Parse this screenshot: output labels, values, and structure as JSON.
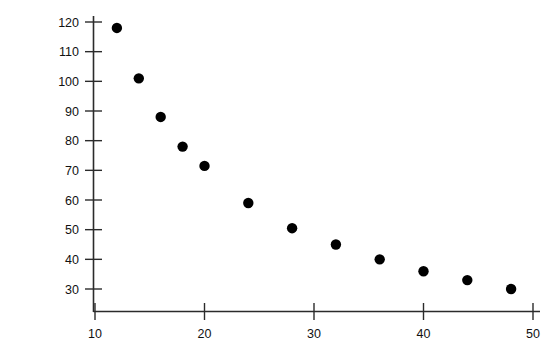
{
  "chart_data": {
    "type": "scatter",
    "title": "",
    "xlabel": "",
    "ylabel": "Pressure (in. of Hg)",
    "xlim": [
      8,
      50
    ],
    "ylim": [
      25,
      124
    ],
    "grid": false,
    "legend": null,
    "xticks": [
      10,
      20,
      30,
      40,
      50
    ],
    "xticklabels": [
      "10",
      "20",
      "30",
      "40",
      "50"
    ],
    "yticks": [
      30,
      40,
      50,
      60,
      70,
      80,
      90,
      100,
      110,
      120
    ],
    "yticklabels": [
      "30",
      "40",
      "50",
      "60",
      "70",
      "80",
      "90",
      "100",
      "110",
      "120"
    ],
    "x": [
      12,
      14,
      16,
      18,
      20,
      24,
      28,
      32,
      36,
      40,
      44,
      48
    ],
    "y": [
      118,
      101,
      88,
      78,
      71.5,
      59,
      50.5,
      45,
      40,
      36,
      33,
      30
    ],
    "points": [
      {
        "x": 12,
        "y": 118
      },
      {
        "x": 14,
        "y": 101
      },
      {
        "x": 16,
        "y": 88
      },
      {
        "x": 18,
        "y": 78
      },
      {
        "x": 20,
        "y": 71.5
      },
      {
        "x": 24,
        "y": 59
      },
      {
        "x": 28,
        "y": 50.5
      },
      {
        "x": 32,
        "y": 45
      },
      {
        "x": 36,
        "y": 40
      },
      {
        "x": 40,
        "y": 36
      },
      {
        "x": 44,
        "y": 33
      },
      {
        "x": 48,
        "y": 30
      }
    ],
    "marker": "filled-circle",
    "marker_color": "#000000",
    "marker_size": 5.2,
    "axis_color": "#2b2b2b",
    "background": "#ffffff"
  }
}
